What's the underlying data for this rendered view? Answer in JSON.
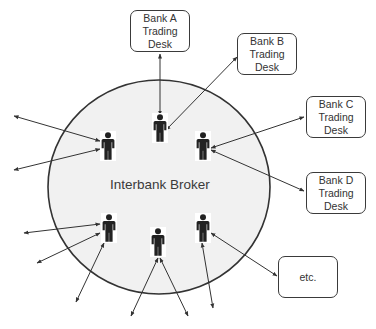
{
  "diagram": {
    "center": {
      "label": "Interbank Broker",
      "fill": "#f1f1f1",
      "stroke": "#333333"
    },
    "boxes": [
      {
        "id": "bank-a",
        "label": "Bank A\nTrading\nDesk",
        "x": 130,
        "y": 10,
        "w": 60,
        "h": 42
      },
      {
        "id": "bank-b",
        "label": "Bank B\nTrading\nDesk",
        "x": 237,
        "y": 33,
        "w": 60,
        "h": 42
      },
      {
        "id": "bank-c",
        "label": "Bank C\nTrading\nDesk",
        "x": 306,
        "y": 96,
        "w": 60,
        "h": 42
      },
      {
        "id": "bank-d",
        "label": "Bank D\nTrading\nDesk",
        "x": 306,
        "y": 172,
        "w": 60,
        "h": 42
      },
      {
        "id": "etc",
        "label": "etc.",
        "x": 278,
        "y": 256,
        "w": 60,
        "h": 42
      }
    ],
    "people": [
      {
        "x": 160,
        "y": 128
      },
      {
        "x": 108,
        "y": 146
      },
      {
        "x": 203,
        "y": 146
      },
      {
        "x": 109,
        "y": 228
      },
      {
        "x": 158,
        "y": 242
      },
      {
        "x": 203,
        "y": 228
      }
    ],
    "arrows": [
      {
        "x1": 160,
        "y1": 54,
        "x2": 160,
        "y2": 115
      },
      {
        "x1": 237,
        "y1": 57,
        "x2": 166,
        "y2": 130
      },
      {
        "x1": 304,
        "y1": 117,
        "x2": 211,
        "y2": 148
      },
      {
        "x1": 304,
        "y1": 191,
        "x2": 211,
        "y2": 150
      },
      {
        "x1": 277,
        "y1": 276,
        "x2": 211,
        "y2": 233
      },
      {
        "x1": 14,
        "y1": 116,
        "x2": 100,
        "y2": 141
      },
      {
        "x1": 14,
        "y1": 170,
        "x2": 100,
        "y2": 149
      },
      {
        "x1": 24,
        "y1": 233,
        "x2": 100,
        "y2": 224
      },
      {
        "x1": 37,
        "y1": 263,
        "x2": 100,
        "y2": 233
      },
      {
        "x1": 76,
        "y1": 302,
        "x2": 104,
        "y2": 243
      },
      {
        "x1": 131,
        "y1": 316,
        "x2": 158,
        "y2": 258
      },
      {
        "x1": 188,
        "y1": 316,
        "x2": 160,
        "y2": 258
      },
      {
        "x1": 213,
        "y1": 308,
        "x2": 202,
        "y2": 243
      }
    ]
  }
}
